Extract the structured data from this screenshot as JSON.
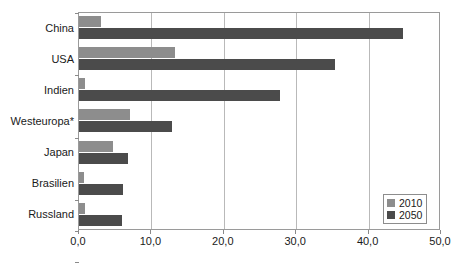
{
  "chart_data": {
    "type": "bar",
    "orientation": "horizontal",
    "title": "",
    "subtitle": "",
    "xlabel": "",
    "ylabel": "",
    "categories": [
      "China",
      "USA",
      "Indien",
      "Westeuropa*",
      "Japan",
      "Brasilien",
      "Russland"
    ],
    "series": [
      {
        "name": "2010",
        "color": "#8d8d8d",
        "values": [
          3.0,
          13.3,
          0.8,
          7.0,
          4.7,
          0.7,
          0.8
        ]
      },
      {
        "name": "2050",
        "color": "#4b4b4b",
        "values": [
          44.7,
          35.3,
          27.8,
          12.8,
          6.7,
          6.1,
          5.9
        ]
      }
    ],
    "xlim": [
      0.0,
      50.0
    ],
    "xticks": [
      0.0,
      10.0,
      20.0,
      30.0,
      40.0,
      50.0
    ],
    "xtick_labels": [
      "0,0",
      "10,0",
      "20,0",
      "30,0",
      "40,0",
      "50,0"
    ],
    "grid": "vertical",
    "legend_position": "bottom-right",
    "legend_entries": [
      "2010",
      "2050"
    ],
    "footnote": "*"
  },
  "legend": {
    "entries": [
      {
        "label": "2010",
        "color": "#8d8d8d"
      },
      {
        "label": "2050",
        "color": "#4b4b4b"
      }
    ]
  },
  "axis": {
    "x_tick_labels": [
      "0,0",
      "10,0",
      "20,0",
      "30,0",
      "40,0",
      "50,0"
    ]
  },
  "categories": [
    {
      "label": "China"
    },
    {
      "label": "USA"
    },
    {
      "label": "Indien"
    },
    {
      "label": "Westeuropa*"
    },
    {
      "label": "Japan"
    },
    {
      "label": "Brasilien"
    },
    {
      "label": "Russland"
    }
  ],
  "colors": {
    "series_2010": "#8d8d8d",
    "series_2050": "#4b4b4b",
    "gridline": "#b9b9b9",
    "frame": "#9a9a9a",
    "background": "#ffffff",
    "text": "#1a1a1a"
  }
}
